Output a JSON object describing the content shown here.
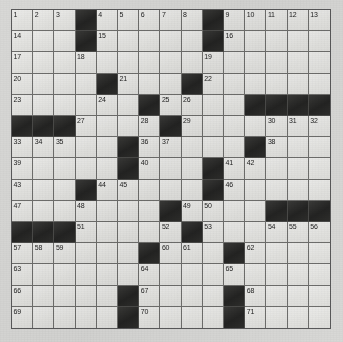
{
  "puzzle": {
    "title": "Crossword Grid",
    "type": "crossword",
    "rows": 15,
    "cols": 15,
    "colors": {
      "paper": "#d8d8d6",
      "white_cell": "#e7e7e4",
      "black_cell": "#2b2b2a",
      "grid_line": "#6e6e6c",
      "number_text": "#1c1c1c"
    },
    "grid": [
      [
        {
          "b": false,
          "n": "1"
        },
        {
          "b": false,
          "n": "2"
        },
        {
          "b": false,
          "n": "3"
        },
        {
          "b": true,
          "n": ""
        },
        {
          "b": false,
          "n": "4"
        },
        {
          "b": false,
          "n": "5"
        },
        {
          "b": false,
          "n": "6"
        },
        {
          "b": false,
          "n": "7"
        },
        {
          "b": false,
          "n": "8"
        },
        {
          "b": true,
          "n": ""
        },
        {
          "b": false,
          "n": "9"
        },
        {
          "b": false,
          "n": "10"
        },
        {
          "b": false,
          "n": "11"
        },
        {
          "b": false,
          "n": "12"
        },
        {
          "b": false,
          "n": "13"
        }
      ],
      [
        {
          "b": false,
          "n": "14"
        },
        {
          "b": false,
          "n": ""
        },
        {
          "b": false,
          "n": ""
        },
        {
          "b": true,
          "n": ""
        },
        {
          "b": false,
          "n": "15"
        },
        {
          "b": false,
          "n": ""
        },
        {
          "b": false,
          "n": ""
        },
        {
          "b": false,
          "n": ""
        },
        {
          "b": false,
          "n": ""
        },
        {
          "b": true,
          "n": ""
        },
        {
          "b": false,
          "n": "16"
        },
        {
          "b": false,
          "n": ""
        },
        {
          "b": false,
          "n": ""
        },
        {
          "b": false,
          "n": ""
        },
        {
          "b": false,
          "n": ""
        }
      ],
      [
        {
          "b": false,
          "n": "17"
        },
        {
          "b": false,
          "n": ""
        },
        {
          "b": false,
          "n": ""
        },
        {
          "b": false,
          "n": "18"
        },
        {
          "b": false,
          "n": ""
        },
        {
          "b": false,
          "n": ""
        },
        {
          "b": false,
          "n": ""
        },
        {
          "b": false,
          "n": ""
        },
        {
          "b": false,
          "n": ""
        },
        {
          "b": false,
          "n": "19"
        },
        {
          "b": false,
          "n": ""
        },
        {
          "b": false,
          "n": ""
        },
        {
          "b": false,
          "n": ""
        },
        {
          "b": false,
          "n": ""
        },
        {
          "b": false,
          "n": ""
        }
      ],
      [
        {
          "b": false,
          "n": "20"
        },
        {
          "b": false,
          "n": ""
        },
        {
          "b": false,
          "n": ""
        },
        {
          "b": false,
          "n": ""
        },
        {
          "b": true,
          "n": ""
        },
        {
          "b": false,
          "n": "21"
        },
        {
          "b": false,
          "n": ""
        },
        {
          "b": false,
          "n": ""
        },
        {
          "b": true,
          "n": ""
        },
        {
          "b": false,
          "n": "22"
        },
        {
          "b": false,
          "n": ""
        },
        {
          "b": false,
          "n": ""
        },
        {
          "b": false,
          "n": ""
        },
        {
          "b": false,
          "n": ""
        },
        {
          "b": false,
          "n": ""
        }
      ],
      [
        {
          "b": false,
          "n": "23"
        },
        {
          "b": false,
          "n": ""
        },
        {
          "b": false,
          "n": ""
        },
        {
          "b": false,
          "n": ""
        },
        {
          "b": false,
          "n": "24"
        },
        {
          "b": false,
          "n": ""
        },
        {
          "b": true,
          "n": ""
        },
        {
          "b": false,
          "n": "25"
        },
        {
          "b": false,
          "n": "26"
        },
        {
          "b": false,
          "n": ""
        },
        {
          "b": false,
          "n": ""
        },
        {
          "b": true,
          "n": ""
        },
        {
          "b": true,
          "n": ""
        },
        {
          "b": true,
          "n": ""
        },
        {
          "b": true,
          "n": ""
        }
      ],
      [
        {
          "b": true,
          "n": ""
        },
        {
          "b": true,
          "n": ""
        },
        {
          "b": true,
          "n": ""
        },
        {
          "b": false,
          "n": "27"
        },
        {
          "b": false,
          "n": ""
        },
        {
          "b": false,
          "n": ""
        },
        {
          "b": false,
          "n": "28"
        },
        {
          "b": true,
          "n": ""
        },
        {
          "b": false,
          "n": "29"
        },
        {
          "b": false,
          "n": ""
        },
        {
          "b": false,
          "n": ""
        },
        {
          "b": false,
          "n": ""
        },
        {
          "b": false,
          "n": "30"
        },
        {
          "b": false,
          "n": "31"
        },
        {
          "b": false,
          "n": "32"
        }
      ],
      [
        {
          "b": false,
          "n": "33"
        },
        {
          "b": false,
          "n": "34"
        },
        {
          "b": false,
          "n": "35"
        },
        {
          "b": false,
          "n": ""
        },
        {
          "b": false,
          "n": ""
        },
        {
          "b": true,
          "n": ""
        },
        {
          "b": false,
          "n": "36"
        },
        {
          "b": false,
          "n": "37"
        },
        {
          "b": false,
          "n": ""
        },
        {
          "b": false,
          "n": ""
        },
        {
          "b": false,
          "n": ""
        },
        {
          "b": true,
          "n": ""
        },
        {
          "b": false,
          "n": "38"
        },
        {
          "b": false,
          "n": ""
        },
        {
          "b": false,
          "n": ""
        }
      ],
      [
        {
          "b": false,
          "n": "39"
        },
        {
          "b": false,
          "n": ""
        },
        {
          "b": false,
          "n": ""
        },
        {
          "b": false,
          "n": ""
        },
        {
          "b": false,
          "n": ""
        },
        {
          "b": true,
          "n": ""
        },
        {
          "b": false,
          "n": "40"
        },
        {
          "b": false,
          "n": ""
        },
        {
          "b": false,
          "n": ""
        },
        {
          "b": true,
          "n": ""
        },
        {
          "b": false,
          "n": "41"
        },
        {
          "b": false,
          "n": "42"
        },
        {
          "b": false,
          "n": ""
        },
        {
          "b": false,
          "n": ""
        },
        {
          "b": false,
          "n": ""
        }
      ],
      [
        {
          "b": false,
          "n": "43"
        },
        {
          "b": false,
          "n": ""
        },
        {
          "b": false,
          "n": ""
        },
        {
          "b": true,
          "n": ""
        },
        {
          "b": false,
          "n": "44"
        },
        {
          "b": false,
          "n": "45"
        },
        {
          "b": false,
          "n": ""
        },
        {
          "b": false,
          "n": ""
        },
        {
          "b": false,
          "n": ""
        },
        {
          "b": true,
          "n": ""
        },
        {
          "b": false,
          "n": "46"
        },
        {
          "b": false,
          "n": ""
        },
        {
          "b": false,
          "n": ""
        },
        {
          "b": false,
          "n": ""
        },
        {
          "b": false,
          "n": ""
        }
      ],
      [
        {
          "b": false,
          "n": "47"
        },
        {
          "b": false,
          "n": ""
        },
        {
          "b": false,
          "n": ""
        },
        {
          "b": false,
          "n": "48"
        },
        {
          "b": false,
          "n": ""
        },
        {
          "b": false,
          "n": ""
        },
        {
          "b": false,
          "n": ""
        },
        {
          "b": true,
          "n": ""
        },
        {
          "b": false,
          "n": "49"
        },
        {
          "b": false,
          "n": "50"
        },
        {
          "b": false,
          "n": ""
        },
        {
          "b": false,
          "n": ""
        },
        {
          "b": true,
          "n": ""
        },
        {
          "b": true,
          "n": ""
        },
        {
          "b": true,
          "n": ""
        }
      ],
      [
        {
          "b": true,
          "n": ""
        },
        {
          "b": true,
          "n": ""
        },
        {
          "b": true,
          "n": ""
        },
        {
          "b": false,
          "n": "51"
        },
        {
          "b": false,
          "n": ""
        },
        {
          "b": false,
          "n": ""
        },
        {
          "b": false,
          "n": ""
        },
        {
          "b": false,
          "n": "52"
        },
        {
          "b": true,
          "n": ""
        },
        {
          "b": false,
          "n": "53"
        },
        {
          "b": false,
          "n": ""
        },
        {
          "b": false,
          "n": ""
        },
        {
          "b": false,
          "n": "54"
        },
        {
          "b": false,
          "n": "55"
        },
        {
          "b": false,
          "n": "56"
        }
      ],
      [
        {
          "b": false,
          "n": "57"
        },
        {
          "b": false,
          "n": "58"
        },
        {
          "b": false,
          "n": "59"
        },
        {
          "b": false,
          "n": ""
        },
        {
          "b": false,
          "n": ""
        },
        {
          "b": false,
          "n": ""
        },
        {
          "b": true,
          "n": ""
        },
        {
          "b": false,
          "n": "60"
        },
        {
          "b": false,
          "n": "61"
        },
        {
          "b": false,
          "n": ""
        },
        {
          "b": true,
          "n": ""
        },
        {
          "b": false,
          "n": "62"
        },
        {
          "b": false,
          "n": ""
        },
        {
          "b": false,
          "n": ""
        },
        {
          "b": false,
          "n": ""
        }
      ],
      [
        {
          "b": false,
          "n": "63"
        },
        {
          "b": false,
          "n": ""
        },
        {
          "b": false,
          "n": ""
        },
        {
          "b": false,
          "n": ""
        },
        {
          "b": false,
          "n": ""
        },
        {
          "b": false,
          "n": ""
        },
        {
          "b": false,
          "n": "64"
        },
        {
          "b": false,
          "n": ""
        },
        {
          "b": false,
          "n": ""
        },
        {
          "b": false,
          "n": ""
        },
        {
          "b": false,
          "n": "65"
        },
        {
          "b": false,
          "n": ""
        },
        {
          "b": false,
          "n": ""
        },
        {
          "b": false,
          "n": ""
        },
        {
          "b": false,
          "n": ""
        }
      ],
      [
        {
          "b": false,
          "n": "66"
        },
        {
          "b": false,
          "n": ""
        },
        {
          "b": false,
          "n": ""
        },
        {
          "b": false,
          "n": ""
        },
        {
          "b": false,
          "n": ""
        },
        {
          "b": true,
          "n": ""
        },
        {
          "b": false,
          "n": "67"
        },
        {
          "b": false,
          "n": ""
        },
        {
          "b": false,
          "n": ""
        },
        {
          "b": false,
          "n": ""
        },
        {
          "b": true,
          "n": ""
        },
        {
          "b": false,
          "n": "68"
        },
        {
          "b": false,
          "n": ""
        },
        {
          "b": false,
          "n": ""
        },
        {
          "b": false,
          "n": ""
        }
      ],
      [
        {
          "b": false,
          "n": "69"
        },
        {
          "b": false,
          "n": ""
        },
        {
          "b": false,
          "n": ""
        },
        {
          "b": false,
          "n": ""
        },
        {
          "b": false,
          "n": ""
        },
        {
          "b": true,
          "n": ""
        },
        {
          "b": false,
          "n": "70"
        },
        {
          "b": false,
          "n": ""
        },
        {
          "b": false,
          "n": ""
        },
        {
          "b": false,
          "n": ""
        },
        {
          "b": true,
          "n": ""
        },
        {
          "b": false,
          "n": "71"
        },
        {
          "b": false,
          "n": ""
        },
        {
          "b": false,
          "n": ""
        },
        {
          "b": false,
          "n": ""
        }
      ]
    ]
  }
}
